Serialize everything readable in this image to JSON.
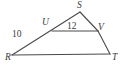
{
  "figure": {
    "kind": "geometry-triangle-diagram",
    "background_color": "#ffffff",
    "stroke_color": "#4a4a4a",
    "text_color": "#3b3b3b",
    "vertex_labels": {
      "S": "S",
      "U": "U",
      "V": "V",
      "R": "R",
      "T": "T"
    },
    "measure_labels": {
      "uv": "12",
      "ru": "10"
    }
  },
  "geometry": {
    "points": {
      "S": {
        "x": 80,
        "y": 12
      },
      "U": {
        "x": 52,
        "y": 31
      },
      "V": {
        "x": 98,
        "y": 31
      },
      "R": {
        "x": 12,
        "y": 55
      },
      "T": {
        "x": 110,
        "y": 54
      }
    },
    "segments": [
      {
        "name": "RS",
        "from": "R",
        "to": "S"
      },
      {
        "name": "SV",
        "from": "S",
        "to": "V"
      },
      {
        "name": "VT",
        "from": "V",
        "to": "T"
      },
      {
        "name": "RT",
        "from": "R",
        "to": "T"
      },
      {
        "name": "UV",
        "from": "U",
        "to": "V"
      }
    ]
  }
}
